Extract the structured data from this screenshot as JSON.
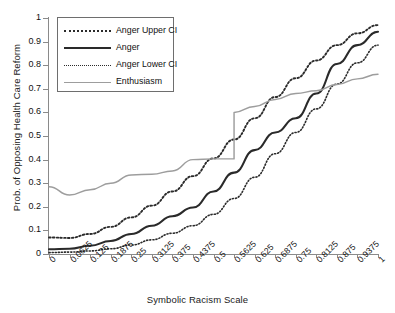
{
  "chart_data": {
    "type": "line",
    "title": "",
    "xlabel": "Symbolic Racism Scale",
    "ylabel": "Prob. of Opposing Health Care Reform",
    "xlim": [
      0,
      1
    ],
    "ylim": [
      0,
      1
    ],
    "grid": false,
    "legend_position": "top-left",
    "x": [
      0,
      0.0625,
      0.125,
      0.1875,
      0.25,
      0.3125,
      0.375,
      0.4375,
      0.5,
      0.5625,
      0.625,
      0.6875,
      0.75,
      0.8125,
      0.875,
      0.9375,
      1
    ],
    "categories": [
      "0",
      "0.0625",
      "0.125",
      "0.1875",
      "0.25",
      "0.3125",
      "0.375",
      "0.4375",
      "0.5",
      "0.5625",
      "0.625",
      "0.6875",
      "0.75",
      "0.8125",
      "0.875",
      "0.9375",
      "1"
    ],
    "yticks": [
      "0",
      "0.1",
      "0.2",
      "0.3",
      "0.4",
      "0.5",
      "0.6",
      "0.7",
      "0.8",
      "0.9",
      "1"
    ],
    "ytick_values": [
      0,
      0.1,
      0.2,
      0.3,
      0.4,
      0.5,
      0.6,
      0.7,
      0.8,
      0.9,
      1
    ],
    "series": [
      {
        "name": "Anger Upper CI",
        "style": "dotted",
        "color": "#2b2b2b",
        "width": 1.9,
        "values": [
          0.07,
          0.068,
          0.085,
          0.115,
          0.155,
          0.205,
          0.265,
          0.33,
          0.405,
          0.485,
          0.575,
          0.665,
          0.745,
          0.82,
          0.885,
          0.935,
          0.97
        ]
      },
      {
        "name": "Anger",
        "style": "solid",
        "color": "#2a2a2a",
        "width": 2.1,
        "values": [
          0.02,
          0.022,
          0.035,
          0.055,
          0.085,
          0.12,
          0.16,
          0.197,
          0.265,
          0.345,
          0.44,
          0.515,
          0.575,
          0.68,
          0.805,
          0.885,
          0.942
        ]
      },
      {
        "name": "Anger Lower CI",
        "style": "dotted",
        "color": "#2b2b2b",
        "width": 1.6,
        "values": [
          0.006,
          0.008,
          0.013,
          0.022,
          0.038,
          0.06,
          0.088,
          0.12,
          0.168,
          0.235,
          0.325,
          0.425,
          0.515,
          0.615,
          0.72,
          0.81,
          0.885
        ]
      },
      {
        "name": "Enthusiasm",
        "style": "solid",
        "color": "#9d9d9d",
        "width": 1.45,
        "values": [
          0.285,
          0.25,
          0.272,
          0.3,
          0.335,
          0.338,
          0.352,
          0.4,
          0.403,
          0.403,
          0.445,
          0.49,
          0.505,
          0.512,
          0.578,
          0.58,
          0.6
        ]
      }
    ],
    "series_extra": {
      "Enthusiasm_tail": [
        0.6,
        0.625,
        0.655,
        0.68,
        0.692,
        0.718,
        0.742,
        0.762
      ]
    },
    "legend": [
      {
        "label": "Anger Upper CI",
        "style": "dotted",
        "color": "#2b2b2b"
      },
      {
        "label": "Anger",
        "style": "solid",
        "color": "#2a2a2a"
      },
      {
        "label": "Anger Lower CI",
        "style": "dotted",
        "color": "#2b2b2b"
      },
      {
        "label": "Enthusiasm",
        "style": "solid",
        "color": "#9d9d9d"
      }
    ]
  }
}
